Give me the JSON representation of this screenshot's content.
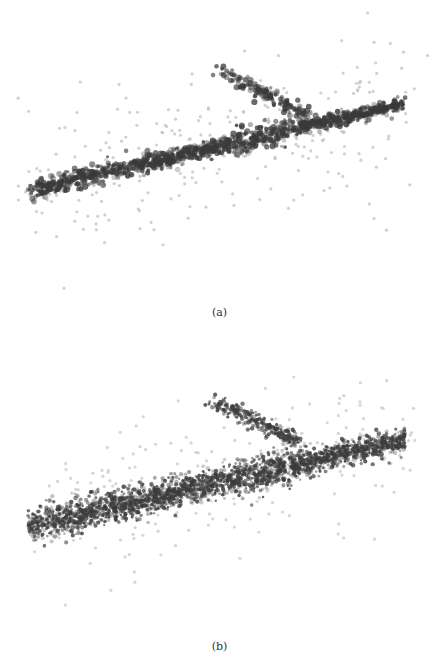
{
  "figure": {
    "panels": [
      {
        "id": "a",
        "caption": "(a)",
        "description": "Sparse 3D point cloud: dense elongated diagonal band with branch above, large dark clustered blobs",
        "style": {
          "point_size_dense": 2.6,
          "point_size_sparse": 1.6,
          "dense_color": "#3a3a3a",
          "sparse_color": "#bdbdbd",
          "clumpy": true
        },
        "band": {
          "x0": 30,
          "y0": 190,
          "x1": 403,
          "y1": 104,
          "width_start": 8,
          "width_end": 5
        },
        "branch": {
          "x0": 220,
          "y0": 70,
          "x1": 310,
          "y1": 118
        },
        "counts": {
          "band": 1300,
          "branch": 140,
          "scatter": 260
        },
        "seed": 7
      },
      {
        "id": "b",
        "caption": "(b)",
        "description": "Denser 3D point cloud: wider diagonal band with branch above, finer speckled points",
        "style": {
          "point_size_dense": 1.9,
          "point_size_sparse": 1.6,
          "dense_color": "#3c3c3c",
          "sparse_color": "#c4c4c4",
          "clumpy": false
        },
        "band": {
          "x0": 28,
          "y0": 196,
          "x1": 405,
          "y1": 110,
          "width_start": 14,
          "width_end": 9
        },
        "branch": {
          "x0": 215,
          "y0": 72,
          "x1": 300,
          "y1": 112
        },
        "counts": {
          "band": 2600,
          "branch": 260,
          "scatter": 220
        },
        "seed": 11
      }
    ]
  }
}
